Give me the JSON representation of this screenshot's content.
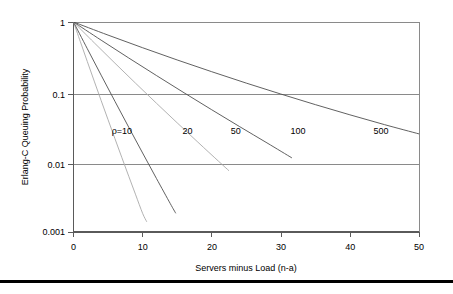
{
  "chart_data": {
    "type": "line",
    "title": "",
    "xlabel": "Servers  minus Load (n-a)",
    "ylabel": "Erlang-C Queuing Probability",
    "xlim": [
      0,
      50
    ],
    "ylim": [
      0.001,
      1
    ],
    "yscale": "log",
    "xticks": [
      0,
      10,
      20,
      30,
      40,
      50
    ],
    "xtick_labels": [
      "0",
      "10",
      "20",
      "30",
      "40",
      "50"
    ],
    "yticks": [
      1,
      0.1,
      0.01,
      0.001
    ],
    "ytick_labels": [
      "1",
      "0.1",
      "0.01",
      "0.001"
    ],
    "grid": "horizontal-at-0.1-and-0.01",
    "legend_position": "inline-annotations",
    "annotations": [
      {
        "text": "ρ=10",
        "x": 7.0,
        "y": 0.0255
      },
      {
        "text": "20",
        "x": 16.5,
        "y": 0.0255
      },
      {
        "text": "50",
        "x": 23.5,
        "y": 0.0255
      },
      {
        "text": "100",
        "x": 32.5,
        "y": 0.0255
      },
      {
        "text": "500",
        "x": 44.5,
        "y": 0.0255
      }
    ],
    "series": [
      {
        "name": "ρ=10",
        "style": "solid-faint",
        "x": [
          0,
          1,
          2,
          3,
          4,
          5,
          6,
          7,
          8,
          9,
          10,
          10.6
        ],
        "y": [
          1,
          0.52,
          0.272,
          0.143,
          0.0756,
          0.0402,
          0.0215,
          0.01155,
          0.00624,
          0.00339,
          0.00185,
          0.0014
        ]
      },
      {
        "name": "20",
        "style": "solid",
        "x": [
          0,
          2,
          4,
          6,
          8,
          10,
          12,
          14,
          14.8
        ],
        "y": [
          1,
          0.415,
          0.174,
          0.0735,
          0.0313,
          0.01345,
          0.00583,
          0.00255,
          0.00185
        ]
      },
      {
        "name": "50",
        "style": "solid-faint",
        "x": [
          0,
          3,
          6,
          9,
          12,
          15,
          18,
          21,
          22.5
        ],
        "y": [
          1,
          0.505,
          0.258,
          0.133,
          0.0692,
          0.0363,
          0.0192,
          0.01023,
          0.0075
        ]
      },
      {
        "name": "100",
        "style": "solid",
        "x": [
          0,
          4,
          8,
          12,
          16,
          20,
          24,
          28,
          31.6
        ],
        "y": [
          1,
          0.55,
          0.306,
          0.172,
          0.0975,
          0.0558,
          0.0322,
          0.01875,
          0.01145
        ]
      },
      {
        "name": "500",
        "style": "solid",
        "x": [
          0,
          5,
          10,
          15,
          20,
          25,
          30,
          35,
          40,
          45,
          50
        ],
        "y": [
          1,
          0.65,
          0.429,
          0.287,
          0.195,
          0.134,
          0.0935,
          0.066,
          0.0472,
          0.0342,
          0.0252
        ]
      }
    ]
  },
  "figure": {
    "background_color": "#ffffff",
    "line_color": "#4f4f4f",
    "grid_color": "#8a8a8a",
    "rule_color": "#000000"
  }
}
